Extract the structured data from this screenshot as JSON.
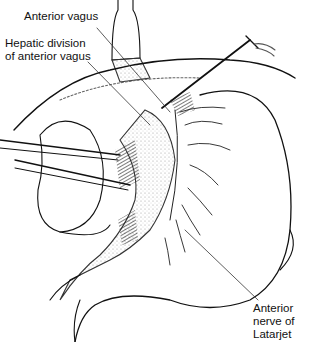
{
  "figure": {
    "type": "surgical anatomical line illustration",
    "labels": [
      {
        "id": "anterior-vagus",
        "text": "Anterior vagus"
      },
      {
        "id": "hepatic-division",
        "line1": "Hepatic division",
        "line2": "of anterior vagus"
      },
      {
        "id": "nerve-latarjet",
        "line1": "Anterior",
        "line2": "nerve of",
        "line3": "Latarjet"
      }
    ]
  }
}
